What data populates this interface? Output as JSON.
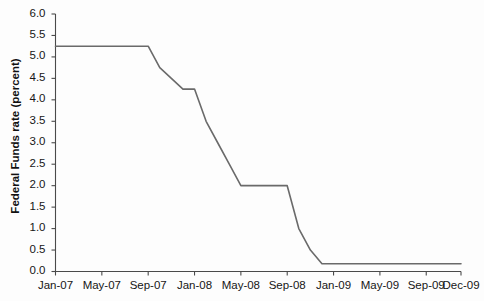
{
  "chart_data": {
    "type": "line",
    "title": "",
    "subtitle": "",
    "xlabel": "",
    "ylabel": "Federal Funds rate (percent)",
    "ylim": [
      0.0,
      6.0
    ],
    "ytick_labels": [
      "0.0",
      "0.5",
      "1.0",
      "1.5",
      "2.0",
      "2.5",
      "3.0",
      "3.5",
      "4.0",
      "4.5",
      "5.0",
      "5.5",
      "6.0"
    ],
    "ytick_values": [
      0.0,
      0.5,
      1.0,
      1.5,
      2.0,
      2.5,
      3.0,
      3.5,
      4.0,
      4.5,
      5.0,
      5.5,
      6.0
    ],
    "xtick_labels": [
      "Jan-07",
      "May-07",
      "Sep-07",
      "Jan-08",
      "May-08",
      "Sep-08",
      "Jan-09",
      "May-09",
      "Sep-09",
      "Dec-09"
    ],
    "xtick_months": [
      0,
      4,
      8,
      12,
      16,
      20,
      24,
      28,
      32,
      35
    ],
    "xlim_months": [
      0,
      35
    ],
    "grid": false,
    "legend": null,
    "series": [
      {
        "name": "Federal Funds rate",
        "color": "#6a6a6a",
        "x_labels": [
          "Jan-07",
          "Feb-07",
          "Mar-07",
          "Apr-07",
          "May-07",
          "Jun-07",
          "Jul-07",
          "Aug-07",
          "Sep-07",
          "Oct-07",
          "Nov-07",
          "Dec-07",
          "Jan-08",
          "Feb-08",
          "Mar-08",
          "Apr-08",
          "May-08",
          "Jun-08",
          "Jul-08",
          "Aug-08",
          "Sep-08",
          "Oct-08",
          "Nov-08",
          "Dec-08",
          "Jan-09",
          "Feb-09",
          "Mar-09",
          "Apr-09",
          "May-09",
          "Jun-09",
          "Jul-09",
          "Aug-09",
          "Sep-09",
          "Oct-09",
          "Nov-09",
          "Dec-09"
        ],
        "x": [
          0,
          1,
          2,
          3,
          4,
          5,
          6,
          7,
          8,
          9,
          10,
          11,
          12,
          13,
          14,
          15,
          16,
          17,
          18,
          19,
          20,
          21,
          22,
          23,
          24,
          25,
          26,
          27,
          28,
          29,
          30,
          31,
          32,
          33,
          34,
          35
        ],
        "values": [
          5.25,
          5.25,
          5.25,
          5.25,
          5.25,
          5.25,
          5.25,
          5.25,
          5.25,
          4.75,
          4.5,
          4.25,
          4.25,
          3.5,
          3.0,
          2.5,
          2.0,
          2.0,
          2.0,
          2.0,
          2.0,
          1.0,
          0.5,
          0.18,
          0.18,
          0.18,
          0.18,
          0.18,
          0.18,
          0.18,
          0.18,
          0.18,
          0.18,
          0.18,
          0.18,
          0.18
        ]
      }
    ]
  },
  "axes": {
    "y_axis_name": "y-axis",
    "x_axis_name": "x-axis"
  }
}
